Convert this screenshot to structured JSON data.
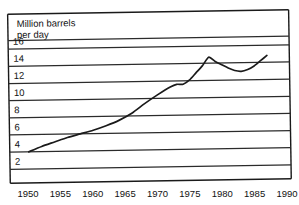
{
  "chart_data": {
    "type": "line",
    "title": "Million barrels per day",
    "title_lines": [
      "Million barrels",
      "per day"
    ],
    "xlabel": "",
    "ylabel": "Million barrels per day",
    "xlim": [
      1950,
      1990
    ],
    "ylim": [
      0,
      17
    ],
    "grid": true,
    "legend": null,
    "x_ticks": [
      1950,
      1955,
      1960,
      1965,
      1970,
      1975,
      1980,
      1985,
      1990
    ],
    "y_ticks": [
      2,
      4,
      6,
      8,
      10,
      12,
      14,
      16
    ],
    "series": [
      {
        "name": "Oil consumption",
        "x": [
          1950,
          1952,
          1954,
          1956,
          1958,
          1960,
          1962,
          1964,
          1966,
          1968,
          1970,
          1972,
          1973,
          1974,
          1975,
          1976,
          1977,
          1978,
          1979,
          1980,
          1981,
          1982,
          1983,
          1984,
          1985,
          1986,
          1987
        ],
        "values": [
          4.0,
          4.6,
          5.1,
          5.6,
          6.0,
          6.4,
          6.9,
          7.5,
          8.3,
          9.4,
          10.4,
          11.3,
          11.6,
          11.6,
          12.1,
          12.9,
          13.7,
          14.7,
          14.2,
          13.8,
          13.4,
          13.1,
          13.0,
          13.2,
          13.6,
          14.2,
          14.8
        ]
      }
    ]
  },
  "axes": {
    "y_tick_labels": [
      "16",
      "14",
      "12",
      "10",
      "8",
      "6",
      "4",
      "2"
    ],
    "x_tick_labels": [
      "1950",
      "1955",
      "1960",
      "1965",
      "1970",
      "1975",
      "1980",
      "1985",
      "1990"
    ]
  },
  "colors": {
    "line": "#1a1a1a",
    "grid": "#2b2b2b",
    "frame": "#1a1a1a",
    "background": "#ffffff",
    "text": "#111111"
  }
}
